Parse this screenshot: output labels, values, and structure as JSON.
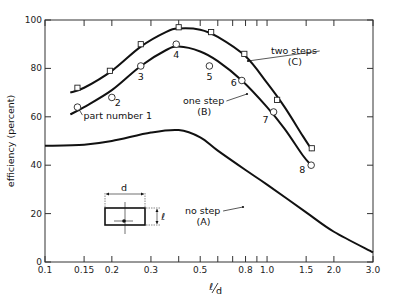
{
  "chart_data": {
    "type": "line",
    "title": "",
    "xlabel": "ℓ/d",
    "ylabel": "efficiency (percent)",
    "xscale": "log",
    "xlim": [
      0.1,
      3.0
    ],
    "ylim": [
      0,
      100
    ],
    "x_ticks": [
      0.1,
      0.15,
      0.2,
      0.3,
      0.5,
      0.8,
      1.0,
      1.5,
      2.0,
      3.0
    ],
    "x_tick_labels": [
      "0.1",
      "0.15",
      "0.2",
      "0.3",
      "0.5",
      "0.8",
      "1.0",
      "1.5",
      "2.0",
      "3.0"
    ],
    "x_minor_ticks": [
      0.4,
      0.6,
      0.7,
      0.9
    ],
    "y_ticks": [
      0,
      20,
      40,
      60,
      80,
      100
    ],
    "y_tick_labels": [
      "0",
      "20",
      "40",
      "60",
      "80",
      "100"
    ],
    "grid": false,
    "series": [
      {
        "name": "no step (A)",
        "label_line1": "no step",
        "label_line2": "(A)",
        "marker": "none",
        "curve": [
          [
            0.1,
            48
          ],
          [
            0.15,
            48.5
          ],
          [
            0.2,
            50
          ],
          [
            0.3,
            53.5
          ],
          [
            0.4,
            54.5
          ],
          [
            0.5,
            51.5
          ],
          [
            0.6,
            46
          ],
          [
            0.8,
            38
          ],
          [
            1.0,
            32
          ],
          [
            1.5,
            20.5
          ],
          [
            2.0,
            12.5
          ],
          [
            3.0,
            4
          ]
        ]
      },
      {
        "name": "one step (B)",
        "label_line1": "one step",
        "label_line2": "(B)",
        "marker": "circle",
        "points": [
          [
            0.14,
            64
          ],
          [
            0.2,
            68
          ],
          [
            0.27,
            81
          ],
          [
            0.39,
            90
          ],
          [
            0.55,
            81
          ],
          [
            0.77,
            75
          ],
          [
            1.07,
            62
          ],
          [
            1.58,
            40
          ]
        ],
        "point_labels": [
          "part number 1",
          "2",
          "3",
          "4",
          "5",
          "6",
          "7",
          "8"
        ],
        "curve": [
          [
            0.13,
            61
          ],
          [
            0.15,
            64
          ],
          [
            0.2,
            71
          ],
          [
            0.27,
            81
          ],
          [
            0.35,
            87.5
          ],
          [
            0.4,
            89
          ],
          [
            0.5,
            87
          ],
          [
            0.6,
            83
          ],
          [
            0.77,
            75
          ],
          [
            1.0,
            64
          ],
          [
            1.2,
            55
          ],
          [
            1.45,
            44
          ],
          [
            1.58,
            40
          ]
        ]
      },
      {
        "name": "two steps (C)",
        "label_line1": "two steps",
        "label_line2": "(C)",
        "marker": "square",
        "points": [
          [
            0.14,
            72
          ],
          [
            0.196,
            79
          ],
          [
            0.27,
            90
          ],
          [
            0.4,
            97
          ],
          [
            0.56,
            95
          ],
          [
            0.79,
            86
          ],
          [
            1.11,
            67
          ],
          [
            1.59,
            47
          ]
        ],
        "curve": [
          [
            0.13,
            70
          ],
          [
            0.15,
            72
          ],
          [
            0.2,
            79
          ],
          [
            0.27,
            89
          ],
          [
            0.35,
            95
          ],
          [
            0.4,
            96.5
          ],
          [
            0.5,
            96
          ],
          [
            0.6,
            93
          ],
          [
            0.8,
            85
          ],
          [
            1.0,
            74
          ],
          [
            1.2,
            64
          ],
          [
            1.45,
            52
          ],
          [
            1.6,
            46
          ]
        ]
      }
    ],
    "inset": {
      "description": "rectangle cross-section diagram",
      "width_label": "d",
      "height_label": "ℓ"
    }
  },
  "labels": {
    "ylabel": "efficiency (percent)",
    "xlabel_num": "ℓ",
    "xlabel_den": "d",
    "part_number": "part number 1",
    "inset_d": "d",
    "inset_l": "ℓ"
  }
}
